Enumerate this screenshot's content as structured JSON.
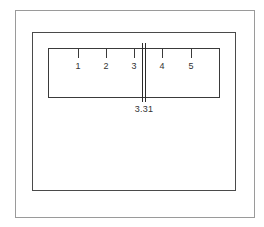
{
  "diagram": {
    "title": "",
    "scale": {
      "ticks": [
        {
          "label": "1",
          "x": 78
        },
        {
          "label": "2",
          "x": 106
        },
        {
          "label": "3",
          "x": 134
        },
        {
          "label": "4",
          "x": 162
        },
        {
          "label": "5",
          "x": 191
        }
      ]
    },
    "cursor": {
      "reading": "3.31",
      "value": 3.31
    },
    "colors": {
      "outer_frame": "#9a9a9a",
      "inner_frame": "#4a4a4a",
      "scale_line": "#3a3a3a",
      "text": "#333333"
    }
  }
}
